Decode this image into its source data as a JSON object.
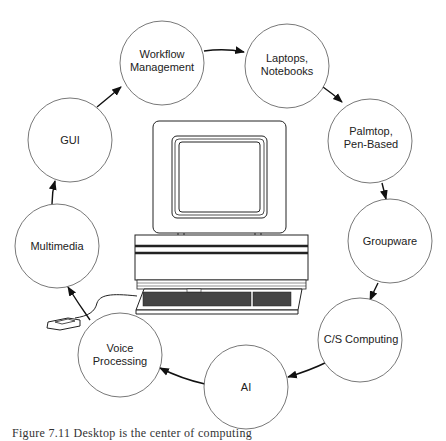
{
  "diagram": {
    "type": "cycle",
    "center_illustration": "desktop-computer",
    "nodes": [
      {
        "id": "workflow",
        "lines": [
          "Workflow",
          "Management"
        ],
        "cx": 162,
        "cy": 63,
        "r": 42
      },
      {
        "id": "laptops",
        "lines": [
          "Laptops,",
          "Notebooks"
        ],
        "cx": 287,
        "cy": 66,
        "r": 42
      },
      {
        "id": "palmtop",
        "lines": [
          "Palmtop,",
          "Pen-Based"
        ],
        "cx": 370,
        "cy": 141,
        "r": 42
      },
      {
        "id": "groupware",
        "lines": [
          "Groupware"
        ],
        "cx": 390,
        "cy": 241,
        "r": 42
      },
      {
        "id": "cs-computing",
        "lines": [
          "C/S Computing"
        ],
        "cx": 360,
        "cy": 340,
        "r": 42
      },
      {
        "id": "ai",
        "lines": [
          "AI"
        ],
        "cx": 246,
        "cy": 387,
        "r": 42
      },
      {
        "id": "voice",
        "lines": [
          "Voice",
          "Processing"
        ],
        "cx": 120,
        "cy": 355,
        "r": 42
      },
      {
        "id": "multimedia",
        "lines": [
          "Multimedia"
        ],
        "cx": 57,
        "cy": 246,
        "r": 42
      },
      {
        "id": "gui",
        "lines": [
          "GUI"
        ],
        "cx": 70,
        "cy": 140,
        "r": 42
      }
    ],
    "edges": [
      {
        "from": "gui",
        "to": "workflow"
      },
      {
        "from": "workflow",
        "to": "laptops"
      },
      {
        "from": "laptops",
        "to": "palmtop"
      },
      {
        "from": "palmtop",
        "to": "groupware"
      },
      {
        "from": "groupware",
        "to": "cs-computing"
      },
      {
        "from": "cs-computing",
        "to": "ai"
      },
      {
        "from": "ai",
        "to": "voice"
      },
      {
        "from": "voice",
        "to": "multimedia"
      },
      {
        "from": "multimedia",
        "to": "gui"
      }
    ]
  },
  "labels": {
    "workflow_1": "Workflow",
    "workflow_2": "Management",
    "laptops_1": "Laptops,",
    "laptops_2": "Notebooks",
    "palmtop_1": "Palmtop,",
    "palmtop_2": "Pen-Based",
    "groupware": "Groupware",
    "cs": "C/S Computing",
    "ai": "AI",
    "voice_1": "Voice",
    "voice_2": "Processing",
    "multimedia": "Multimedia",
    "gui": "GUI"
  },
  "caption": "Figure 7.11  Desktop is the center of computing"
}
